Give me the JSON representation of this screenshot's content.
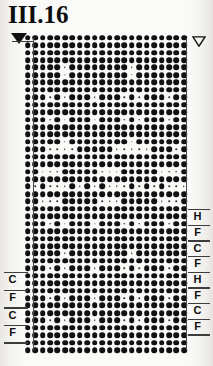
{
  "document": {
    "title": "III.16",
    "type": "punch-card-pattern-chart"
  },
  "chart": {
    "left_marker_icon": "filled-down-triangle",
    "right_marker_icon": "outlined-down-triangle",
    "columns": 22,
    "rows": 43,
    "dot_filled_label": "punched",
    "dot_empty_label": "unpunched"
  },
  "markers": {
    "left": [
      {
        "label": "C"
      },
      {
        "label": "F"
      },
      {
        "label": "C"
      },
      {
        "label": "F"
      }
    ],
    "right": [
      {
        "label": "H"
      },
      {
        "label": "F"
      },
      {
        "label": "C"
      },
      {
        "label": "F"
      },
      {
        "label": "H"
      },
      {
        "label": "F"
      },
      {
        "label": "C"
      },
      {
        "label": "F"
      }
    ]
  },
  "colors": {
    "ink": "#111111",
    "rule": "#3d3d3d",
    "paper": "#fbfbf9"
  },
  "chart_data": {
    "type": "heatmap",
    "title": "III.16",
    "xlabel": "",
    "ylabel": "",
    "legend": [
      "punched",
      "unpunched"
    ],
    "columns": 22,
    "rows": 43,
    "grid": [
      "1111111111111111111111",
      "1111111111111111111111",
      "1111111111111111111111",
      "1111111111111111111111",
      "1111101111111101111111",
      "1111101111111101111111",
      "1111111111111111111111",
      "1111111111111111111111",
      "1110101110111010111011",
      "1111111111111111111111",
      "1111111111111111111111",
      "1110101110111010111011",
      "1111111111111111111111",
      "1111111111111111111111",
      "1111101111111101111111",
      "1110000111110000011101",
      "1111111111111111111111",
      "1111111111111111111111",
      "1100011111000111110001",
      "1111111111111111111111",
      "1010001010100010101000",
      "1111111111111111111111",
      "1100011111000111110001",
      "1111111111111111111111",
      "1111111111111111111111",
      "1110101110111010111011",
      "1111111111111111111111",
      "1111111111111111111111",
      "1111111111111111111111",
      "1111101111111101111111",
      "1111111111111111111111",
      "1110101110111010111011",
      "1111111111111111111111",
      "1111111111111111111111",
      "1111111111111111111111",
      "1110101110111010111011",
      "1111111111111111111111",
      "1111111111111111111111",
      "1110101110111010111011",
      "1111111111111111111111",
      "1111111111111111111111",
      "1111111111111111111111",
      "1111111111111111111111"
    ]
  }
}
